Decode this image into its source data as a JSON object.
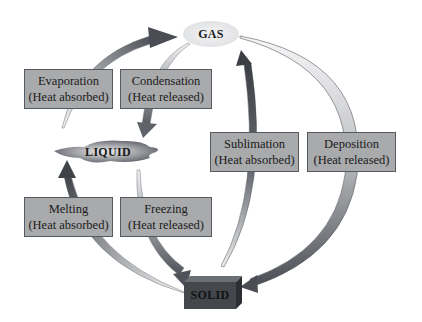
{
  "diagram": {
    "states": {
      "gas": "GAS",
      "liquid": "LIQUID",
      "solid": "SOLID"
    },
    "transitions": [
      {
        "name": "Evaporation",
        "heat": "(Heat absorbed)",
        "from": "LIQUID",
        "to": "GAS"
      },
      {
        "name": "Condensation",
        "heat": "(Heat released)",
        "from": "GAS",
        "to": "LIQUID"
      },
      {
        "name": "Melting",
        "heat": "(Heat absorbed)",
        "from": "SOLID",
        "to": "LIQUID"
      },
      {
        "name": "Freezing",
        "heat": "(Heat released)",
        "from": "LIQUID",
        "to": "SOLID"
      },
      {
        "name": "Sublimation",
        "heat": "(Heat absorbed)",
        "from": "SOLID",
        "to": "GAS"
      },
      {
        "name": "Deposition",
        "heat": "(Heat released)",
        "from": "GAS",
        "to": "SOLID"
      }
    ],
    "colors": {
      "box_fill": "#a9aaac",
      "box_border": "#555a60",
      "arrow_dark": "#4a4e54",
      "arrow_light": "#dcdddf",
      "solid_block": "#3a3d42"
    }
  }
}
